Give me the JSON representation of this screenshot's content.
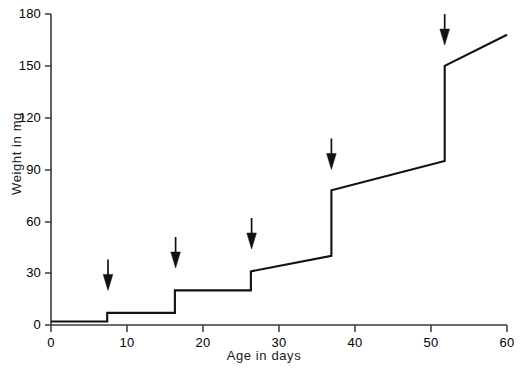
{
  "chart_data": {
    "type": "line",
    "title": "",
    "subtitle": "",
    "xlabel": "Age in days",
    "ylabel": "Weight in mg",
    "xlim": [
      0,
      60
    ],
    "ylim": [
      0,
      180
    ],
    "xticks": [
      0,
      10,
      20,
      30,
      40,
      50,
      60
    ],
    "yticks": [
      0,
      30,
      60,
      90,
      120,
      150,
      180
    ],
    "xtick_labels": [
      "0",
      "10",
      "20",
      "30",
      "40",
      "50",
      "60"
    ],
    "ytick_labels": [
      "0",
      "30",
      "60",
      "90",
      "120",
      "150",
      "180"
    ],
    "grid": false,
    "legend": null,
    "series": [
      {
        "name": "Weight",
        "style": "step-with-growth",
        "points": [
          {
            "x": 0,
            "y": 2
          },
          {
            "x": 7.4,
            "y": 2
          },
          {
            "x": 7.4,
            "y": 7
          },
          {
            "x": 16.3,
            "y": 7
          },
          {
            "x": 16.3,
            "y": 20
          },
          {
            "x": 26.3,
            "y": 20
          },
          {
            "x": 26.3,
            "y": 31
          },
          {
            "x": 36.9,
            "y": 40
          },
          {
            "x": 36.9,
            "y": 78
          },
          {
            "x": 51.8,
            "y": 95
          },
          {
            "x": 51.8,
            "y": 150
          },
          {
            "x": 60,
            "y": 168
          }
        ]
      }
    ],
    "annotations": [
      {
        "kind": "down-arrow",
        "x": 7.5,
        "y_tip": 20,
        "label": "moult-1"
      },
      {
        "kind": "down-arrow",
        "x": 16.4,
        "y_tip": 33,
        "label": "moult-2"
      },
      {
        "kind": "down-arrow",
        "x": 26.4,
        "y_tip": 44,
        "label": "moult-3"
      },
      {
        "kind": "down-arrow",
        "x": 36.9,
        "y_tip": 90,
        "label": "moult-4"
      },
      {
        "kind": "down-arrow",
        "x": 51.8,
        "y_tip": 162,
        "label": "moult-5"
      }
    ]
  }
}
